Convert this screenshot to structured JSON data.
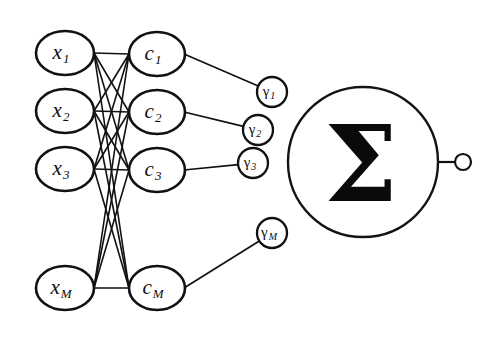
{
  "figure": {
    "kind": "neural-network-diagram",
    "background_color": "#ffffff",
    "stroke_color": "#111111",
    "width": 495,
    "height": 337
  },
  "layers": {
    "input": {
      "name": "input-layer",
      "shape": "ellipse",
      "rx": 29,
      "ry": 22,
      "cx": 65,
      "nodes": [
        {
          "id": "x1",
          "base": "x",
          "sub": "1",
          "cy": 53
        },
        {
          "id": "x2",
          "base": "x",
          "sub": "2",
          "cy": 111
        },
        {
          "id": "x3",
          "base": "x",
          "sub": "3",
          "cy": 169
        },
        {
          "id": "xM",
          "base": "x",
          "sub": "M",
          "cy": 288
        }
      ]
    },
    "hidden": {
      "name": "hidden-layer",
      "shape": "ellipse",
      "rx": 28,
      "ry": 22,
      "cx": 157,
      "nodes": [
        {
          "id": "c1",
          "base": "c",
          "sub": "1",
          "cy": 54
        },
        {
          "id": "c2",
          "base": "c",
          "sub": "2",
          "cy": 112
        },
        {
          "id": "c3",
          "base": "c",
          "sub": "3",
          "cy": 170
        },
        {
          "id": "cM",
          "base": "c",
          "sub": "M",
          "cy": 288
        }
      ]
    },
    "weights": {
      "name": "weight-layer",
      "shape": "circle",
      "r": 15,
      "nodes": [
        {
          "id": "g1",
          "base": "γ",
          "sub": "1",
          "cx": 272,
          "cy": 92
        },
        {
          "id": "g2",
          "base": "γ",
          "sub": "2",
          "cx": 258,
          "cy": 130
        },
        {
          "id": "g3",
          "base": "γ",
          "sub": "3",
          "cx": 253,
          "cy": 163
        },
        {
          "id": "gM",
          "base": "γ",
          "sub": "M",
          "cx": 272,
          "cy": 233
        }
      ]
    },
    "summation": {
      "name": "summation-node",
      "symbol": "Σ",
      "cx": 363,
      "cy": 162,
      "r": 75
    },
    "output": {
      "name": "output-node",
      "cx": 463,
      "cy": 162,
      "r": 8,
      "lead_from_x": 437,
      "lead_to_x": 455
    }
  },
  "edges": {
    "mesh_label": "fully-connected input-to-hidden mesh",
    "mesh_from_x": 94,
    "mesh_to_x": 129,
    "hidden_to_weight_label": "hidden-to-weight links",
    "weight_to_sum_label": "weights attach to summation circle"
  }
}
